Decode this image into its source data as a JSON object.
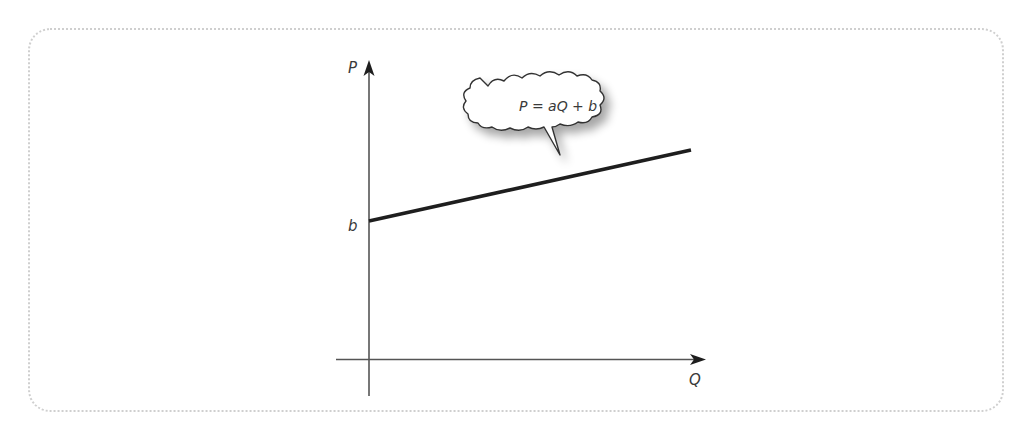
{
  "diagram": {
    "type": "linear-function-graph",
    "y_axis_label": "P",
    "x_axis_label": "Q",
    "intercept_label": "b",
    "callout_text": "P = aQ + b",
    "line": {
      "start": {
        "Q": 0,
        "P": "b"
      },
      "slope": "a",
      "slope_sign": "positive"
    },
    "colors": {
      "axis": "#555555",
      "line": "#1e1e1e",
      "frame": "#cfcfcf",
      "text": "#3a3a3a"
    }
  }
}
